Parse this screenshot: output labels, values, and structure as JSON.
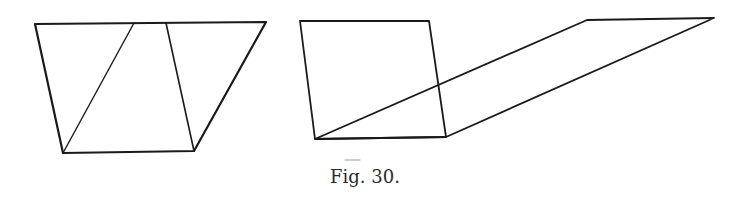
{
  "figure": {
    "caption": "Fig. 30.",
    "stroke_color": "#1a1a1a",
    "background": "#ffffff",
    "left_figure": {
      "description": "Parallelogram dissected into two triangles and a trapezoid",
      "outline": [
        [
          35,
          24
        ],
        [
          266,
          22
        ],
        [
          194,
          151
        ],
        [
          63,
          153
        ]
      ],
      "inner_lines": [
        {
          "from": [
            63,
            153
          ],
          "to": [
            134,
            23
          ]
        },
        {
          "from": [
            166,
            23
          ],
          "to": [
            194,
            151
          ]
        }
      ]
    },
    "right_figure": {
      "description": "Square and an elongated parallelogram of equal base sharing the bottom edge",
      "square": [
        [
          300,
          21
        ],
        [
          429,
          21
        ],
        [
          446,
          137
        ],
        [
          315,
          139
        ]
      ],
      "parallelogram": [
        [
          315,
          139
        ],
        [
          587,
          20
        ],
        [
          714,
          18
        ],
        [
          446,
          137
        ]
      ],
      "stray_mark": {
        "from": [
          345,
          160
        ],
        "to": [
          360,
          160
        ]
      }
    }
  }
}
